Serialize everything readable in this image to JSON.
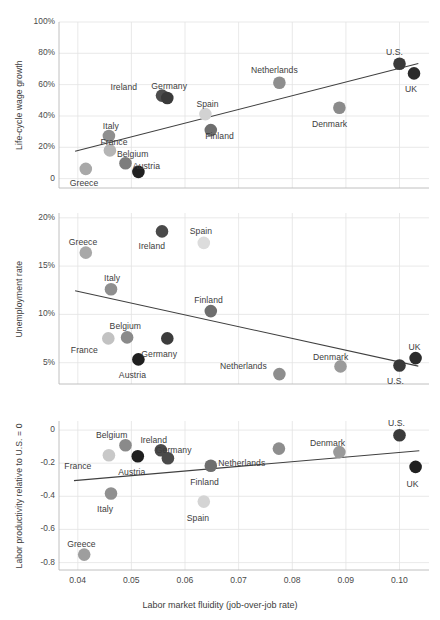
{
  "figure": {
    "width": 440,
    "height": 620,
    "background": "#ffffff",
    "grid_color": "#e3e3e3",
    "axis_color": "#b9b9b9",
    "trendline_color": "#404040",
    "text_color": "#3c3c3c"
  },
  "xaxis": {
    "label": "Labor market fluidity (job-over-job rate)",
    "ticks": [
      "0.04",
      "0.05",
      "0.06",
      "0.07",
      "0.08",
      "0.09",
      "0.10"
    ],
    "tick_values": [
      0.04,
      0.05,
      0.06,
      0.07,
      0.08,
      0.09,
      0.1
    ],
    "min": 0.0365,
    "max": 0.1055
  },
  "chart_data": [
    {
      "type": "scatter",
      "title": "",
      "panel": 1,
      "xlabel": "",
      "ylabel": "Life-cycle wage growth",
      "xlim": [
        0.0365,
        0.1055
      ],
      "ylim": [
        -0.06,
        1.0
      ],
      "grid": true,
      "yticks": [
        "0",
        "20%",
        "40%",
        "60%",
        "80%",
        "100%"
      ],
      "ytick_values": [
        0,
        0.2,
        0.4,
        0.6,
        0.8,
        1.0
      ],
      "trendline": {
        "x0": 0.0395,
        "y0": 0.175,
        "x1": 0.1035,
        "y1": 0.735
      },
      "points": [
        {
          "name": "Greece",
          "x": 0.0415,
          "y": 0.062,
          "color": "#a8a8a8",
          "label_dx": -2,
          "label_dy": 14
        },
        {
          "name": "Italy",
          "x": 0.0458,
          "y": 0.272,
          "color": "#8f8f8f",
          "label_dx": 2,
          "label_dy": -10
        },
        {
          "name": "France",
          "x": 0.046,
          "y": 0.18,
          "color": "#b5b5b5",
          "label_dx": 4,
          "label_dy": -8
        },
        {
          "name": "Belgium",
          "x": 0.0489,
          "y": 0.098,
          "color": "#7d7d7d",
          "label_dx": 7,
          "label_dy": -9
        },
        {
          "name": "Austria",
          "x": 0.0513,
          "y": 0.043,
          "color": "#1f1f1f",
          "label_dx": 8,
          "label_dy": -6
        },
        {
          "name": "Ireland",
          "x": 0.0557,
          "y": 0.53,
          "color": "#4d4d4d",
          "label_dx": -38,
          "label_dy": -9
        },
        {
          "name": "Germany",
          "x": 0.0567,
          "y": 0.515,
          "color": "#3a3a3a",
          "label_dx": 2,
          "label_dy": -12
        },
        {
          "name": "Spain",
          "x": 0.0638,
          "y": 0.412,
          "color": "#d2d2d2",
          "label_dx": 2,
          "label_dy": -10
        },
        {
          "name": "Finland",
          "x": 0.0648,
          "y": 0.31,
          "color": "#6e6e6e",
          "label_dx": 9,
          "label_dy": 6
        },
        {
          "name": "Netherlands",
          "x": 0.0776,
          "y": 0.612,
          "color": "#8e8e8e",
          "label_dx": -5,
          "label_dy": -13
        },
        {
          "name": "Denmark",
          "x": 0.0888,
          "y": 0.452,
          "color": "#8b8b8b",
          "label_dx": -10,
          "label_dy": 16
        },
        {
          "name": "U.S.",
          "x": 0.1,
          "y": 0.733,
          "color": "#3a3a3a",
          "label_dx": -5,
          "label_dy": -12
        },
        {
          "name": "UK",
          "x": 0.1027,
          "y": 0.672,
          "color": "#2b2b2b",
          "label_dx": -3,
          "label_dy": 16
        }
      ]
    },
    {
      "type": "scatter",
      "title": "",
      "panel": 2,
      "xlabel": "",
      "ylabel": "Unemployment rate",
      "xlim": [
        0.0365,
        0.1055
      ],
      "ylim": [
        0.028,
        0.205
      ],
      "grid": true,
      "yticks": [
        "5%",
        "10%",
        "15%",
        "20%"
      ],
      "ytick_values": [
        0.05,
        0.1,
        0.15,
        0.2
      ],
      "trendline": {
        "x0": 0.0395,
        "y0": 0.1245,
        "x1": 0.1035,
        "y1": 0.0465
      },
      "points": [
        {
          "name": "Greece",
          "x": 0.0415,
          "y": 0.164,
          "color": "#a8a8a8",
          "label_dx": -3,
          "label_dy": -11
        },
        {
          "name": "Italy",
          "x": 0.0462,
          "y": 0.126,
          "color": "#8f8f8f",
          "label_dx": 1,
          "label_dy": -11
        },
        {
          "name": "France",
          "x": 0.0457,
          "y": 0.0752,
          "color": "#c2c2c2",
          "label_dx": -24,
          "label_dy": 12
        },
        {
          "name": "Belgium",
          "x": 0.0492,
          "y": 0.0762,
          "color": "#8a8a8a",
          "label_dx": -2,
          "label_dy": -11
        },
        {
          "name": "Austria",
          "x": 0.0513,
          "y": 0.0535,
          "color": "#1f1f1f",
          "label_dx": -6,
          "label_dy": 16
        },
        {
          "name": "Ireland",
          "x": 0.0557,
          "y": 0.186,
          "color": "#4a4a4a",
          "label_dx": -10,
          "label_dy": 15
        },
        {
          "name": "Germany",
          "x": 0.0567,
          "y": 0.0752,
          "color": "#3c3c3c",
          "label_dx": -8,
          "label_dy": 16
        },
        {
          "name": "Spain",
          "x": 0.0635,
          "y": 0.174,
          "color": "#dcdcdc",
          "label_dx": -3,
          "label_dy": -12
        },
        {
          "name": "Finland",
          "x": 0.0648,
          "y": 0.1035,
          "color": "#6e6e6e",
          "label_dx": -2,
          "label_dy": -11
        },
        {
          "name": "Netherlands",
          "x": 0.0776,
          "y": 0.0382,
          "color": "#8e8e8e",
          "label_dx": -36,
          "label_dy": -8
        },
        {
          "name": "Denmark",
          "x": 0.089,
          "y": 0.0462,
          "color": "#9a9a9a",
          "label_dx": -10,
          "label_dy": -9
        },
        {
          "name": "U.S.",
          "x": 0.1,
          "y": 0.0472,
          "color": "#383838",
          "label_dx": -4,
          "label_dy": 16
        },
        {
          "name": "UK",
          "x": 0.103,
          "y": 0.0548,
          "color": "#2b2b2b",
          "label_dx": -1,
          "label_dy": -11
        }
      ]
    },
    {
      "type": "scatter",
      "title": "",
      "panel": 3,
      "xlabel": "Labor market fluidity (job-over-job rate)",
      "ylabel": "Labor productivity relative to U.S. = 0",
      "xlim": [
        0.0365,
        0.1055
      ],
      "ylim": [
        -0.845,
        0.055
      ],
      "grid": true,
      "yticks": [
        "-0.8",
        "-0.6",
        "-0.4",
        "-0.2",
        "0"
      ],
      "ytick_values": [
        -0.8,
        -0.6,
        -0.4,
        -0.2,
        0
      ],
      "trendline": {
        "x0": 0.0393,
        "y0": -0.305,
        "x1": 0.1037,
        "y1": -0.125
      },
      "points": [
        {
          "name": "Greece",
          "x": 0.0412,
          "y": -0.752,
          "color": "#9e9e9e",
          "label_dx": -3,
          "label_dy": -11
        },
        {
          "name": "Italy",
          "x": 0.0462,
          "y": -0.383,
          "color": "#909090",
          "label_dx": -6,
          "label_dy": 15
        },
        {
          "name": "France",
          "x": 0.0458,
          "y": -0.152,
          "color": "#c8c8c8",
          "label_dx": -31,
          "label_dy": 11
        },
        {
          "name": "Belgium",
          "x": 0.0489,
          "y": -0.091,
          "color": "#8a8a8a",
          "label_dx": -14,
          "label_dy": -10
        },
        {
          "name": "Austria",
          "x": 0.0512,
          "y": -0.158,
          "color": "#1f1f1f",
          "label_dx": -6,
          "label_dy": 16
        },
        {
          "name": "Ireland",
          "x": 0.0555,
          "y": -0.122,
          "color": "#4a4a4a",
          "label_dx": -7,
          "label_dy": -10
        },
        {
          "name": "Germany",
          "x": 0.0568,
          "y": -0.17,
          "color": "#4a4a4a",
          "label_dx": 6,
          "label_dy": -8
        },
        {
          "name": "Spain",
          "x": 0.0635,
          "y": -0.432,
          "color": "#d4d4d4",
          "label_dx": -6,
          "label_dy": 16
        },
        {
          "name": "Finland",
          "x": 0.0648,
          "y": -0.215,
          "color": "#6e6e6e",
          "label_dx": -6,
          "label_dy": 16
        },
        {
          "name": "Netherlands",
          "x": 0.0775,
          "y": -0.112,
          "color": "#8e8e8e",
          "label_dx": -37,
          "label_dy": 14
        },
        {
          "name": "Denmark",
          "x": 0.0888,
          "y": -0.133,
          "color": "#9a9a9a",
          "label_dx": -12,
          "label_dy": -9
        },
        {
          "name": "U.S.",
          "x": 0.1,
          "y": -0.031,
          "color": "#3a3a3a",
          "label_dx": -3,
          "label_dy": -12
        },
        {
          "name": "UK",
          "x": 0.103,
          "y": -0.222,
          "color": "#212121",
          "label_dx": -3,
          "label_dy": 17
        }
      ]
    }
  ]
}
